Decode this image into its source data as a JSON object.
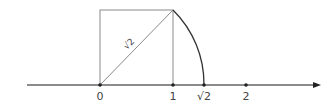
{
  "diagram": {
    "axis": {
      "ticks": [
        {
          "label": "0",
          "value": 0
        },
        {
          "label": "1",
          "value": 1
        },
        {
          "label": "√2",
          "value": 1.414
        },
        {
          "label": "2",
          "value": 2
        }
      ]
    },
    "square": {
      "side": 1
    },
    "diagonal_label": "√2",
    "colors": {
      "lines": "#8a8a8a",
      "arc": "#333333",
      "axis": "#555555",
      "points": "#222222",
      "text": "#444444"
    }
  }
}
